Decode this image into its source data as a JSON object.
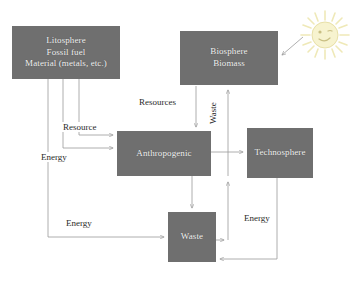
{
  "diagram": {
    "background_color": "#ffffff",
    "node_fill_color": "#6f6f6f",
    "node_text_color": "#f2f2f2",
    "arrow_color": "#9a9a9a",
    "label_text_color": "#2b2b2b",
    "sun_color": "#f5f0c8"
  },
  "nodes": {
    "litosphere": {
      "name": "litosphere",
      "lines": [
        "Litosphere",
        "Fossil fuel",
        "Material (metals, etc.)"
      ],
      "line1": "Litosphere",
      "line2": "Fossil fuel",
      "line3": "Material (metals, etc.)"
    },
    "biosphere": {
      "name": "biosphere",
      "lines": [
        "Biosphere",
        "Biomass"
      ],
      "line1": "Biosphere",
      "line2": "Biomass"
    },
    "anthropogenic": {
      "name": "anthropogenic",
      "label": "Anthropogenic"
    },
    "technosphere": {
      "name": "technosphere",
      "label": "Technosphere"
    },
    "waste": {
      "name": "waste",
      "label": "Waste"
    }
  },
  "edge_labels": {
    "resource_left": "Resource",
    "resources_mid": "Resources",
    "energy_left": "Energy",
    "energy_bottom": "Energy",
    "energy_right": "Energy",
    "waste_vertical": "Waste"
  },
  "icons": {
    "sun": "sun-icon"
  },
  "edges": [
    {
      "from": "litosphere",
      "to": "anthropogenic",
      "label": "Resource"
    },
    {
      "from": "litosphere",
      "to": "anthropogenic",
      "label": "Energy"
    },
    {
      "from": "litosphere",
      "to": "waste",
      "label": "Energy"
    },
    {
      "from": "biosphere",
      "to": "anthropogenic",
      "label": "Resources"
    },
    {
      "from": "anthropogenic",
      "to": "biosphere",
      "label": "Waste"
    },
    {
      "from": "anthropogenic",
      "to": "technosphere",
      "label": ""
    },
    {
      "from": "anthropogenic",
      "to": "waste",
      "label": ""
    },
    {
      "from": "technosphere",
      "to": "waste",
      "label": "Energy"
    },
    {
      "from": "waste",
      "to": "technosphere",
      "label": "Energy"
    },
    {
      "from": "sun",
      "to": "biosphere",
      "label": ""
    }
  ]
}
